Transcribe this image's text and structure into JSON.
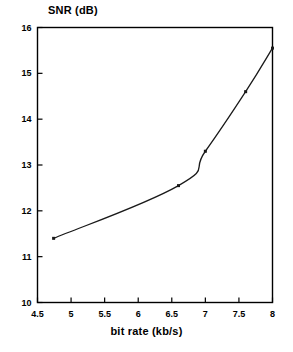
{
  "chart_data": {
    "type": "line",
    "title": "",
    "xlabel": "bit rate (kb/s)",
    "ylabel": "SNR (dB)",
    "xlim": [
      4.5,
      8
    ],
    "ylim": [
      10,
      16
    ],
    "grid": false,
    "legend": null,
    "x_ticks": [
      "4.5",
      "5",
      "5.5",
      "6",
      "6.5",
      "7",
      "7.5",
      "8"
    ],
    "x_tick_values": [
      4.5,
      5,
      5.5,
      6,
      6.5,
      7,
      7.5,
      8
    ],
    "y_ticks": [
      "10",
      "11",
      "12",
      "13",
      "14",
      "15",
      "16"
    ],
    "y_tick_values": [
      10,
      11,
      12,
      13,
      14,
      15,
      16
    ],
    "series": [
      {
        "name": "SNR vs bit rate",
        "marker": "point",
        "color": "#1a1a1a",
        "x": [
          4.74,
          6.6,
          7.0,
          7.6,
          8.0
        ],
        "values": [
          11.4,
          12.55,
          13.3,
          14.6,
          15.55
        ]
      }
    ]
  },
  "axes": {
    "y_title": "SNR (dB)",
    "x_title": "bit rate (kb/s)"
  },
  "style": {
    "line_color": "#1a1a1a",
    "frame_color": "#000000",
    "background": "#ffffff"
  }
}
